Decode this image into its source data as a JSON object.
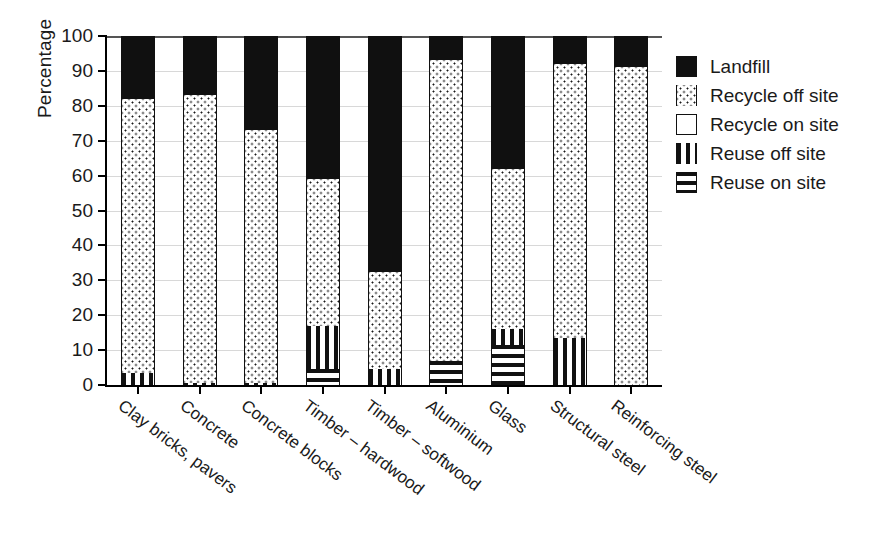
{
  "chart_data": {
    "type": "bar",
    "subtype": "stacked-bar",
    "title": "",
    "xlabel": "",
    "ylabel": "Percentage",
    "ylim": [
      0,
      100
    ],
    "yticks": [
      0,
      10,
      20,
      30,
      40,
      50,
      60,
      70,
      80,
      90,
      100
    ],
    "grid": true,
    "legend_position": "right",
    "stack_order_bottom_to_top": [
      "Reuse on site",
      "Reuse off site",
      "Recycle on site",
      "Recycle off site",
      "Landfill"
    ],
    "categories": [
      "Clay bricks, pavers",
      "Concrete",
      "Concrete blocks",
      "Timber – hardwood",
      "Timber – softwood",
      "Aluminium",
      "Glass",
      "Structural steel",
      "Reinforcing steel"
    ],
    "series": [
      {
        "name": "Reuse on site",
        "pattern": "horizontal-stripes",
        "values": [
          0,
          0,
          0,
          4.5,
          0,
          7,
          11.5,
          0,
          0
        ]
      },
      {
        "name": "Reuse off site",
        "pattern": "vertical-stripes",
        "values": [
          3.5,
          0.5,
          0.5,
          12.5,
          4.5,
          0,
          4.5,
          13.5,
          0
        ]
      },
      {
        "name": "Recycle on site",
        "pattern": "white",
        "values": [
          0,
          0,
          0,
          0,
          0,
          0,
          0,
          0,
          0
        ]
      },
      {
        "name": "Recycle off site",
        "pattern": "dots",
        "values": [
          78.5,
          82.5,
          72.5,
          42,
          28,
          86,
          46,
          78.5,
          91
        ]
      },
      {
        "name": "Landfill",
        "pattern": "solid-black",
        "values": [
          18,
          17,
          27,
          41,
          67.5,
          7,
          38,
          8,
          9
        ]
      }
    ],
    "cumulative_tops": {
      "Clay bricks, pavers": [
        3.5,
        82,
        100
      ],
      "Concrete": [
        0.5,
        83,
        100
      ],
      "Concrete blocks": [
        0.5,
        73,
        100
      ],
      "Timber – hardwood": [
        4.5,
        17,
        59,
        100
      ],
      "Timber – softwood": [
        4.5,
        32.5,
        100
      ],
      "Aluminium": [
        7,
        93,
        100
      ],
      "Glass": [
        11.5,
        16,
        62,
        100
      ],
      "Structural steel": [
        13.5,
        92,
        100
      ],
      "Reinforcing steel": [
        91,
        100
      ]
    }
  },
  "legend": {
    "items": [
      {
        "label": "Landfill",
        "pattern": "solid-black"
      },
      {
        "label": "Recycle off site",
        "pattern": "dots"
      },
      {
        "label": "Recycle on site",
        "pattern": "white"
      },
      {
        "label": "Reuse off site",
        "pattern": "vertical-stripes"
      },
      {
        "label": "Reuse on site",
        "pattern": "horizontal-stripes"
      }
    ]
  },
  "axes": {
    "y_title": "Percentage",
    "y_tick_labels": [
      "0",
      "10",
      "20",
      "30",
      "40",
      "50",
      "60",
      "70",
      "80",
      "90",
      "100"
    ]
  },
  "colors": {
    "ink": "#101010",
    "grid": "#d8d8d8",
    "background": "#ffffff"
  }
}
